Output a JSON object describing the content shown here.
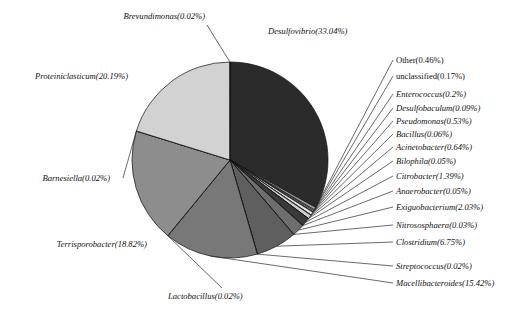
{
  "chart_data": {
    "type": "pie",
    "title": "",
    "subtitle": "",
    "xlabel": "",
    "ylabel": "",
    "legend_position": "none",
    "grid": false,
    "labels_show_percent": true,
    "total_percent": 100.0,
    "categories": [
      "Desulfovibrio",
      "Other",
      "unclassified",
      "Enterococcus",
      "Desulfobaculum",
      "Pseudomonas",
      "Bacillus",
      "Acinetobacter",
      "Bilophila",
      "Citrobacter",
      "Anaerobacter",
      "Exiguobacterium",
      "Nitrososphaera",
      "Clostridium",
      "Streptococcus",
      "Macellibacteroides",
      "Lactobacillus",
      "Terrisporobacter",
      "Barnesiella",
      "Proteiniclasticum",
      "Brevundimonas"
    ],
    "values": [
      33.04,
      0.46,
      0.17,
      0.2,
      0.09,
      0.53,
      0.06,
      0.64,
      0.05,
      1.39,
      0.05,
      2.03,
      0.03,
      6.75,
      0.02,
      15.42,
      0.02,
      18.82,
      0.02,
      20.19,
      0.02
    ],
    "slices": [
      {
        "name": "Desulfovibrio",
        "value": 33.04,
        "label": "Desulfovibrio(33.04%)",
        "color": "#2b2b2b",
        "italic": true,
        "side": "top"
      },
      {
        "name": "Other",
        "value": 0.46,
        "label": "Other(0.46%)",
        "color": "#9a9a9a",
        "italic": false,
        "side": "right"
      },
      {
        "name": "unclassified",
        "value": 0.17,
        "label": "unclassified(0.17%)",
        "color": "#efefef",
        "italic": false,
        "side": "right"
      },
      {
        "name": "Enterococcus",
        "value": 0.2,
        "label": "Enterococcus(0.2%)",
        "color": "#c3c3c3",
        "italic": true,
        "side": "right"
      },
      {
        "name": "Desulfobaculum",
        "value": 0.09,
        "label": "Desulfobaculum(0.09%)",
        "color": "#8e8e8e",
        "italic": true,
        "side": "right"
      },
      {
        "name": "Pseudomonas",
        "value": 0.53,
        "label": "Pseudomonas(0.53%)",
        "color": "#e2e2e2",
        "italic": true,
        "side": "right"
      },
      {
        "name": "Bacillus",
        "value": 0.06,
        "label": "Bacillus(0.06%)",
        "color": "#707070",
        "italic": true,
        "side": "right"
      },
      {
        "name": "Acinetobacter",
        "value": 0.64,
        "label": "Acinetobacter(0.64%)",
        "color": "#cfcfcf",
        "italic": true,
        "side": "right"
      },
      {
        "name": "Bilophila",
        "value": 0.05,
        "label": "Bilophila(0.05%)",
        "color": "#9d9d9d",
        "italic": true,
        "side": "right"
      },
      {
        "name": "Citrobacter",
        "value": 1.39,
        "label": "Citrobacter(1.39%)",
        "color": "#3a3a3a",
        "italic": true,
        "side": "right"
      },
      {
        "name": "Anaerobacter",
        "value": 0.05,
        "label": "Anaerobacter(0.05%)",
        "color": "#8a8a8a",
        "italic": true,
        "side": "right"
      },
      {
        "name": "Exiguobacterium",
        "value": 2.03,
        "label": "Exiguobacterium(2.03%)",
        "color": "#6e6e6e",
        "italic": true,
        "side": "right"
      },
      {
        "name": "Nitrososphaera",
        "value": 0.03,
        "label": "Nitrososphaera(0.03%)",
        "color": "#b8b8b8",
        "italic": true,
        "side": "right"
      },
      {
        "name": "Clostridium",
        "value": 6.75,
        "label": "Clostridium(6.75%)",
        "color": "#5f5f5f",
        "italic": true,
        "side": "right"
      },
      {
        "name": "Streptococcus",
        "value": 0.02,
        "label": "Streptococcus(0.02%)",
        "color": "#9b9b9b",
        "italic": true,
        "side": "right"
      },
      {
        "name": "Macellibacteroides",
        "value": 15.42,
        "label": "Macellibacteroides(15.42%)",
        "color": "#787878",
        "italic": true,
        "side": "right"
      },
      {
        "name": "Lactobacillus",
        "value": 0.02,
        "label": "Lactobacillus(0.02%)",
        "color": "#9e9e9e",
        "italic": true,
        "side": "bottom"
      },
      {
        "name": "Terrisporobacter",
        "value": 18.82,
        "label": "Terrisporobacter(18.82%)",
        "color": "#8d8d8d",
        "italic": true,
        "side": "left"
      },
      {
        "name": "Barnesiella",
        "value": 0.02,
        "label": "Barnesiella(0.02%)",
        "color": "#c9c9c9",
        "italic": true,
        "side": "left"
      },
      {
        "name": "Proteiniclasticum",
        "value": 20.19,
        "label": "Proteiniclasticum(20.19%)",
        "color": "#d2d2d2",
        "italic": true,
        "side": "left"
      },
      {
        "name": "Brevundimonas",
        "value": 0.02,
        "label": "Brevundimonas(0.02%)",
        "color": "#efefef",
        "italic": true,
        "side": "top"
      }
    ],
    "geometry": {
      "center_x": 230,
      "center_y": 160,
      "radius": 98,
      "start_angle_deg": -90,
      "direction": "clockwise"
    },
    "style": {
      "outline_color": "#111111",
      "leader_color": "#2a2a2a",
      "background": "#ffffff",
      "text_color": "#111111"
    }
  },
  "labels": {
    "desulfovibrio": "Desulfovibrio(33.04%)",
    "brevundimonas": "Brevundimonas(0.02%)",
    "proteiniclasticum": "Proteiniclasticum(20.19%)",
    "barnesiella": "Barnesiella(0.02%)",
    "terrisporobacter": "Terrisporobacter(18.82%)",
    "lactobacillus": "Lactobacillus(0.02%)",
    "other": "Other(0.46%)",
    "unclassified": "unclassified(0.17%)",
    "enterococcus": "Enterococcus(0.2%)",
    "desulfobaculum": "Desulfobaculum(0.09%)",
    "pseudomonas": "Pseudomonas(0.53%)",
    "bacillus": "Bacillus(0.06%)",
    "acinetobacter": "Acinetobacter(0.64%)",
    "bilophila": "Bilophila(0.05%)",
    "citrobacter": "Citrobacter(1.39%)",
    "anaerobacter": "Anaerobacter(0.05%)",
    "exiguobacterium": "Exiguobacterium(2.03%)",
    "nitrososphaera": "Nitrososphaera(0.03%)",
    "clostridium": "Clostridium(6.75%)",
    "streptococcus": "Streptococcus(0.02%)",
    "macellibacteroides": "Macellibacteroides(15.42%)"
  }
}
